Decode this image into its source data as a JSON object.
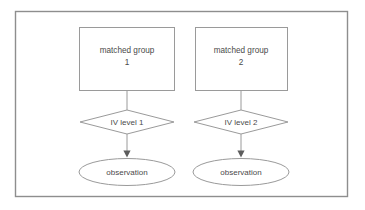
{
  "diagram": {
    "colors": {
      "background": "#ffffff",
      "shape_stroke": "#9a9a9a",
      "frame_stroke": "#8e8e8e",
      "text": "#4a4a4a",
      "arrow_fill": "#5d5d5d"
    },
    "frame": {
      "label": "diagram-frame"
    },
    "columns": [
      {
        "group_box": {
          "line1": "matched group",
          "line2": "1"
        },
        "diamond": {
          "label": "IV level 1"
        },
        "ellipse": {
          "label": "observation"
        }
      },
      {
        "group_box": {
          "line1": "matched group",
          "line2": "2"
        },
        "diamond": {
          "label": "IV level 2"
        },
        "ellipse": {
          "label": "observation"
        }
      }
    ]
  }
}
